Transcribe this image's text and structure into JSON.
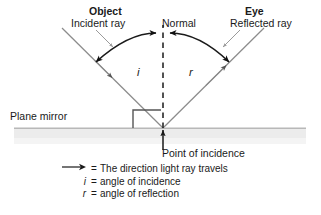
{
  "diagram": {
    "labels": {
      "object": "Object",
      "incident_ray": "Incident ray",
      "eye": "Eye",
      "reflected_ray": "Reflected ray",
      "normal": "Normal",
      "angle_i": "i",
      "angle_r": "r",
      "plane_mirror": "Plane mirror",
      "point_of_incidence": "Point of incidence"
    },
    "legend": [
      {
        "key": "arrow-icon",
        "key_text": "",
        "equals": "=",
        "text": "The direction light ray travels",
        "italic": false
      },
      {
        "key": "i",
        "key_text": "i",
        "equals": "=",
        "text": "angle of incidence",
        "italic": true
      },
      {
        "key": "r",
        "key_text": "r",
        "equals": "=",
        "text": "angle of reflection",
        "italic": true
      }
    ],
    "colors": {
      "ray": "#8c8c8c",
      "arrowhead": "#4d4d4d",
      "arc": "#1a1a1a",
      "normal_dash": "#1a1a1a",
      "mirror_band": "#ebebeb",
      "mirror_surface": "#b5b5b5",
      "text": "#1a1a1a",
      "background": "#ffffff"
    },
    "geometry": {
      "point_of_incidence": {
        "x": 163,
        "y": 128
      },
      "normal_top": {
        "x": 163,
        "y": 30
      },
      "incident_start": {
        "x": 62,
        "y": 28
      },
      "reflected_end": {
        "x": 264,
        "y": 28
      },
      "mirror_line_y": 128,
      "mirror_band_left": 14,
      "mirror_band_right": 306,
      "mirror_band_bottom": 143
    }
  }
}
